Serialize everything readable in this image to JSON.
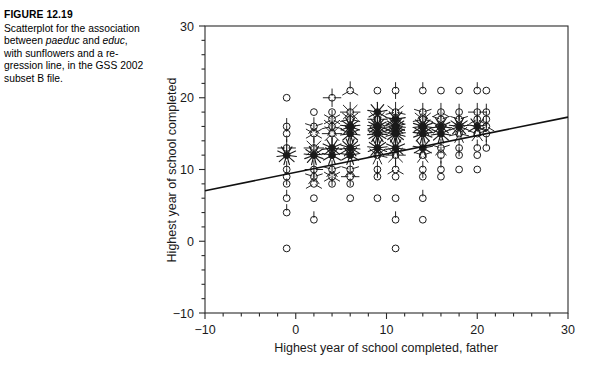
{
  "caption": {
    "figure_label": "FIGURE 12.19",
    "line1": "Scatterplot for the",
    "line2": "association between",
    "line3_a": "paeduc",
    "line3_b": " and ",
    "line3_c": "educ",
    "line3_d": ", with",
    "line4": "sunflowers and a re-",
    "line5": "gression line, in the GSS",
    "line6": "2002 subset B file."
  },
  "chart_data": {
    "type": "scatter",
    "title": "",
    "xlabel": "Highest year of school completed, father",
    "ylabel": "Highest year of school completed",
    "xlim": [
      -10,
      30
    ],
    "ylim": [
      -10,
      30
    ],
    "xticks": [
      -10,
      0,
      10,
      20,
      30
    ],
    "yticks": [
      -10,
      0,
      10,
      20,
      30
    ],
    "xtick_labels": [
      "−10",
      "0",
      "10",
      "20",
      "30"
    ],
    "ytick_labels": [
      "−10",
      "0",
      "10",
      "20",
      "30"
    ],
    "minor_tick_step": 2,
    "grid": false,
    "legend": "none",
    "marker": "sunflower",
    "marker_note": "open circle = 1 case; each petal = 1 additional case",
    "axis_color": "#2b2b2b",
    "marker_color": "#1a1a1a",
    "regression_line": {
      "x": [
        -10,
        30
      ],
      "y": [
        7.05,
        17.3
      ],
      "color": "#111111",
      "width": 1.6
    },
    "points": [
      {
        "x": -1,
        "y": 20,
        "n": 1
      },
      {
        "x": -1,
        "y": 16,
        "n": 2
      },
      {
        "x": -1,
        "y": 15,
        "n": 3
      },
      {
        "x": -1,
        "y": 13,
        "n": 5
      },
      {
        "x": -1,
        "y": 12,
        "n": 12
      },
      {
        "x": -1,
        "y": 10,
        "n": 2
      },
      {
        "x": -1,
        "y": 9,
        "n": 3
      },
      {
        "x": -1,
        "y": 8,
        "n": 1
      },
      {
        "x": -1,
        "y": 6,
        "n": 2
      },
      {
        "x": -1,
        "y": 4,
        "n": 2
      },
      {
        "x": -1,
        "y": -1,
        "n": 1
      },
      {
        "x": 2,
        "y": 18,
        "n": 1
      },
      {
        "x": 2,
        "y": 16,
        "n": 6
      },
      {
        "x": 2,
        "y": 15,
        "n": 7
      },
      {
        "x": 2,
        "y": 13,
        "n": 9
      },
      {
        "x": 2,
        "y": 12,
        "n": 14
      },
      {
        "x": 2,
        "y": 10,
        "n": 5
      },
      {
        "x": 2,
        "y": 9,
        "n": 6
      },
      {
        "x": 2,
        "y": 8,
        "n": 4
      },
      {
        "x": 2,
        "y": 6,
        "n": 1
      },
      {
        "x": 2,
        "y": 3,
        "n": 2
      },
      {
        "x": 4,
        "y": 20,
        "n": 5
      },
      {
        "x": 4,
        "y": 18,
        "n": 1
      },
      {
        "x": 4,
        "y": 17,
        "n": 7
      },
      {
        "x": 4,
        "y": 16,
        "n": 8
      },
      {
        "x": 4,
        "y": 15,
        "n": 9
      },
      {
        "x": 4,
        "y": 13,
        "n": 12
      },
      {
        "x": 4,
        "y": 12,
        "n": 10
      },
      {
        "x": 4,
        "y": 10,
        "n": 6
      },
      {
        "x": 4,
        "y": 9,
        "n": 7
      },
      {
        "x": 4,
        "y": 8,
        "n": 2
      },
      {
        "x": 6,
        "y": 21,
        "n": 4
      },
      {
        "x": 6,
        "y": 18,
        "n": 9
      },
      {
        "x": 6,
        "y": 17,
        "n": 8
      },
      {
        "x": 6,
        "y": 16,
        "n": 14
      },
      {
        "x": 6,
        "y": 15,
        "n": 12
      },
      {
        "x": 6,
        "y": 13,
        "n": 16
      },
      {
        "x": 6,
        "y": 12,
        "n": 10
      },
      {
        "x": 6,
        "y": 10,
        "n": 6
      },
      {
        "x": 6,
        "y": 9,
        "n": 5
      },
      {
        "x": 6,
        "y": 8,
        "n": 1
      },
      {
        "x": 6,
        "y": 6,
        "n": 1
      },
      {
        "x": 9,
        "y": 21,
        "n": 1
      },
      {
        "x": 9,
        "y": 18,
        "n": 10
      },
      {
        "x": 9,
        "y": 17,
        "n": 9
      },
      {
        "x": 9,
        "y": 16,
        "n": 18
      },
      {
        "x": 9,
        "y": 15,
        "n": 16
      },
      {
        "x": 9,
        "y": 13,
        "n": 14
      },
      {
        "x": 9,
        "y": 12,
        "n": 8
      },
      {
        "x": 9,
        "y": 10,
        "n": 3
      },
      {
        "x": 9,
        "y": 9,
        "n": 2
      },
      {
        "x": 9,
        "y": 6,
        "n": 1
      },
      {
        "x": 11,
        "y": 21,
        "n": 3
      },
      {
        "x": 11,
        "y": 18,
        "n": 8
      },
      {
        "x": 11,
        "y": 17,
        "n": 10
      },
      {
        "x": 11,
        "y": 16,
        "n": 20
      },
      {
        "x": 11,
        "y": 15,
        "n": 18
      },
      {
        "x": 11,
        "y": 13,
        "n": 12
      },
      {
        "x": 11,
        "y": 12,
        "n": 9
      },
      {
        "x": 11,
        "y": 10,
        "n": 4
      },
      {
        "x": 11,
        "y": 9,
        "n": 1
      },
      {
        "x": 11,
        "y": 6,
        "n": 1
      },
      {
        "x": 11,
        "y": 3,
        "n": 2
      },
      {
        "x": 11,
        "y": -1,
        "n": 1
      },
      {
        "x": 14,
        "y": 21,
        "n": 2
      },
      {
        "x": 14,
        "y": 18,
        "n": 6
      },
      {
        "x": 14,
        "y": 17,
        "n": 8
      },
      {
        "x": 14,
        "y": 16,
        "n": 16
      },
      {
        "x": 14,
        "y": 15,
        "n": 14
      },
      {
        "x": 14,
        "y": 13,
        "n": 10
      },
      {
        "x": 14,
        "y": 12,
        "n": 6
      },
      {
        "x": 14,
        "y": 10,
        "n": 3
      },
      {
        "x": 14,
        "y": 9,
        "n": 1
      },
      {
        "x": 14,
        "y": 6,
        "n": 2
      },
      {
        "x": 14,
        "y": 3,
        "n": 1
      },
      {
        "x": 16,
        "y": 21,
        "n": 1
      },
      {
        "x": 16,
        "y": 18,
        "n": 4
      },
      {
        "x": 16,
        "y": 17,
        "n": 6
      },
      {
        "x": 16,
        "y": 16,
        "n": 12
      },
      {
        "x": 16,
        "y": 15,
        "n": 12
      },
      {
        "x": 16,
        "y": 13,
        "n": 6
      },
      {
        "x": 16,
        "y": 12,
        "n": 3
      },
      {
        "x": 16,
        "y": 10,
        "n": 2
      },
      {
        "x": 16,
        "y": 9,
        "n": 1
      },
      {
        "x": 18,
        "y": 21,
        "n": 1
      },
      {
        "x": 18,
        "y": 18,
        "n": 3
      },
      {
        "x": 18,
        "y": 17,
        "n": 6
      },
      {
        "x": 18,
        "y": 16,
        "n": 14
      },
      {
        "x": 18,
        "y": 15,
        "n": 8
      },
      {
        "x": 18,
        "y": 13,
        "n": 3
      },
      {
        "x": 18,
        "y": 12,
        "n": 2
      },
      {
        "x": 18,
        "y": 10,
        "n": 1
      },
      {
        "x": 20,
        "y": 21,
        "n": 2
      },
      {
        "x": 20,
        "y": 18,
        "n": 5
      },
      {
        "x": 20,
        "y": 17,
        "n": 4
      },
      {
        "x": 20,
        "y": 16,
        "n": 10
      },
      {
        "x": 20,
        "y": 15,
        "n": 6
      },
      {
        "x": 20,
        "y": 13,
        "n": 2
      },
      {
        "x": 20,
        "y": 12,
        "n": 1
      },
      {
        "x": 20,
        "y": 10,
        "n": 1
      },
      {
        "x": 21,
        "y": 21,
        "n": 1
      },
      {
        "x": 21,
        "y": 18,
        "n": 2
      },
      {
        "x": 21,
        "y": 17,
        "n": 3
      },
      {
        "x": 21,
        "y": 16,
        "n": 4
      },
      {
        "x": 21,
        "y": 15,
        "n": 3
      },
      {
        "x": 21,
        "y": 13,
        "n": 2
      }
    ]
  }
}
